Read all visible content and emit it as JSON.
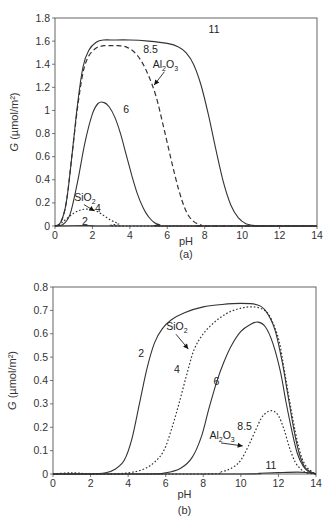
{
  "chart_data": [
    {
      "type": "line",
      "caption": "(a)",
      "xlabel": "pH",
      "ylabel": "G (µmol/m²)",
      "xlim": [
        0,
        14
      ],
      "ylim": [
        0,
        1.8
      ],
      "xticks": [
        0,
        2,
        4,
        6,
        8,
        10,
        12,
        14
      ],
      "yticks": [
        0,
        0.2,
        0.4,
        0.6,
        0.8,
        1,
        1.2,
        1.4,
        1.6,
        1.8
      ],
      "ytick_labels": [
        "0",
        "0.2",
        "0.4",
        "0.6",
        "0.8",
        "1",
        "1.2",
        "1.4",
        "1.6",
        "1.8"
      ],
      "grid": false,
      "series": [
        {
          "name": "11",
          "style": "solid",
          "x": [
            0,
            0.3,
            0.6,
            0.9,
            1.2,
            1.5,
            1.8,
            2.2,
            2.6,
            3,
            4,
            5,
            6,
            6.6,
            7,
            7.4,
            7.8,
            8.2,
            8.6,
            9,
            9.4,
            9.8,
            10.2,
            10.6,
            11,
            14
          ],
          "y": [
            0,
            0.03,
            0.2,
            0.6,
            1.05,
            1.38,
            1.52,
            1.59,
            1.61,
            1.61,
            1.61,
            1.6,
            1.58,
            1.55,
            1.5,
            1.4,
            1.22,
            0.96,
            0.66,
            0.38,
            0.18,
            0.07,
            0.02,
            0.005,
            0,
            0
          ]
        },
        {
          "name": "8.5",
          "style": "dashed",
          "x": [
            0,
            0.3,
            0.6,
            0.9,
            1.2,
            1.5,
            1.8,
            2.2,
            2.6,
            3,
            3.4,
            3.8,
            4.2,
            4.6,
            5,
            5.4,
            5.8,
            6.2,
            6.6,
            7,
            7.4,
            7.8,
            8,
            14
          ],
          "y": [
            0,
            0.03,
            0.2,
            0.6,
            1.02,
            1.33,
            1.47,
            1.54,
            1.56,
            1.56,
            1.56,
            1.55,
            1.51,
            1.43,
            1.3,
            1.12,
            0.86,
            0.58,
            0.32,
            0.13,
            0.04,
            0.01,
            0,
            0
          ]
        },
        {
          "name": "6",
          "style": "solid",
          "x": [
            0,
            0.4,
            0.8,
            1.2,
            1.6,
            2,
            2.3,
            2.6,
            2.9,
            3.2,
            3.5,
            3.8,
            4.1,
            4.4,
            4.7,
            5,
            5.3,
            5.6,
            6,
            14
          ],
          "y": [
            0,
            0.01,
            0.1,
            0.38,
            0.72,
            0.97,
            1.06,
            1.07,
            1.03,
            0.94,
            0.8,
            0.62,
            0.44,
            0.28,
            0.16,
            0.08,
            0.03,
            0.01,
            0,
            0
          ]
        },
        {
          "name": "4",
          "style": "dotted",
          "x": [
            0,
            0.3,
            0.6,
            1,
            1.4,
            1.8,
            2.2,
            2.6,
            3,
            3.4,
            3.8,
            14
          ],
          "y": [
            0,
            0.02,
            0.06,
            0.11,
            0.14,
            0.145,
            0.13,
            0.09,
            0.05,
            0.02,
            0,
            0
          ]
        },
        {
          "name": "2",
          "style": "solid",
          "x": [
            0,
            1,
            2,
            3,
            14
          ],
          "y": [
            0,
            0.002,
            0.003,
            0,
            0
          ]
        }
      ],
      "annotations": [
        {
          "text": "11",
          "x": 8.5,
          "y": 1.67
        },
        {
          "text": "8.5",
          "x": 5.1,
          "y": 1.5
        },
        {
          "text": "Al",
          "sub1": "2",
          "mid": "O",
          "sub2": "3",
          "x": 5.9,
          "y": 1.37,
          "arrow_to": [
            5.3,
            1.22
          ]
        },
        {
          "text": "6",
          "x": 3.8,
          "y": 0.98
        },
        {
          "text": "Si",
          "mid": "O",
          "sub2": "2",
          "x": 1.6,
          "y": 0.22,
          "arrow_to": [
            2.1,
            0.13
          ]
        },
        {
          "text": "4",
          "x": 2.3,
          "y": 0.12
        },
        {
          "text": "2",
          "x": 1.6,
          "y": 0.01
        }
      ]
    },
    {
      "type": "line",
      "caption": "(b)",
      "xlabel": "pH",
      "ylabel": "G (µmol/m²)",
      "xlim": [
        0,
        14
      ],
      "ylim": [
        0,
        0.8
      ],
      "xticks": [
        0,
        2,
        4,
        6,
        8,
        10,
        12,
        14
      ],
      "yticks": [
        0,
        0.1,
        0.2,
        0.3,
        0.4,
        0.5,
        0.6,
        0.7,
        0.8
      ],
      "ytick_labels": [
        "0",
        "0.1",
        "0.2",
        "0.3",
        "0.4",
        "0.5",
        "0.6",
        "0.7",
        "0.8"
      ],
      "grid": false,
      "series": [
        {
          "name": "2",
          "style": "solid",
          "x": [
            0,
            2,
            2.8,
            3.3,
            3.8,
            4.2,
            4.6,
            5,
            5.4,
            5.8,
            6.3,
            7,
            8,
            9,
            10,
            10.8,
            11.3,
            11.8,
            12.2,
            12.5,
            12.8,
            13.1,
            13.4,
            13.7,
            14
          ],
          "y": [
            0,
            0,
            0.005,
            0.02,
            0.06,
            0.15,
            0.3,
            0.45,
            0.56,
            0.62,
            0.66,
            0.69,
            0.715,
            0.725,
            0.73,
            0.725,
            0.7,
            0.62,
            0.48,
            0.34,
            0.2,
            0.09,
            0.03,
            0.01,
            0
          ]
        },
        {
          "name": "4",
          "style": "dotted",
          "x": [
            0,
            1,
            2,
            3,
            4,
            4.8,
            5.4,
            5.9,
            6.3,
            6.7,
            7.1,
            7.5,
            8,
            8.6,
            9.2,
            9.8,
            10.4,
            11,
            11.5,
            12,
            12.3,
            12.6,
            12.9,
            13.2,
            13.5,
            13.8,
            14
          ],
          "y": [
            0,
            0.005,
            0,
            0,
            0.005,
            0.02,
            0.05,
            0.1,
            0.19,
            0.3,
            0.42,
            0.53,
            0.6,
            0.65,
            0.685,
            0.705,
            0.715,
            0.71,
            0.68,
            0.58,
            0.45,
            0.31,
            0.18,
            0.08,
            0.03,
            0.01,
            0
          ]
        },
        {
          "name": "6",
          "style": "solid",
          "x": [
            0,
            5,
            6,
            6.8,
            7.4,
            7.9,
            8.3,
            8.7,
            9.1,
            9.5,
            10,
            10.5,
            10.9,
            11.3,
            11.7,
            12.1,
            12.4,
            12.7,
            13,
            13.3,
            13.6,
            14
          ],
          "y": [
            0,
            0,
            0.005,
            0.025,
            0.07,
            0.16,
            0.28,
            0.39,
            0.48,
            0.55,
            0.61,
            0.64,
            0.65,
            0.63,
            0.56,
            0.44,
            0.31,
            0.19,
            0.09,
            0.035,
            0.01,
            0
          ]
        },
        {
          "name": "8.5",
          "style": "dotted",
          "x": [
            0,
            8,
            9,
            9.6,
            10,
            10.4,
            10.8,
            11.1,
            11.4,
            11.7,
            12,
            12.3,
            12.6,
            12.9,
            13.2,
            13.5,
            14
          ],
          "y": [
            0,
            0,
            0.01,
            0.03,
            0.06,
            0.12,
            0.19,
            0.24,
            0.265,
            0.27,
            0.25,
            0.19,
            0.11,
            0.05,
            0.02,
            0.005,
            0
          ]
        },
        {
          "name": "11",
          "style": "solid",
          "x": [
            0,
            10,
            11,
            12,
            13,
            13.5,
            14
          ],
          "y": [
            0,
            0,
            0.003,
            0.006,
            0.008,
            0.006,
            0
          ]
        }
      ],
      "annotations": [
        {
          "text": "2",
          "x": 4.7,
          "y": 0.5
        },
        {
          "text": "Si",
          "mid": "O",
          "sub2": "2",
          "x": 6.6,
          "y": 0.615,
          "arrow_to": [
            7.2,
            0.535
          ]
        },
        {
          "text": "4",
          "x": 6.6,
          "y": 0.43
        },
        {
          "text": "6",
          "x": 8.7,
          "y": 0.38
        },
        {
          "text": "8.5",
          "x": 10.2,
          "y": 0.19
        },
        {
          "text": "Al",
          "sub1": "2",
          "mid": "O",
          "sub2": "3",
          "x": 9.0,
          "y": 0.15,
          "arrow_to": [
            10.1,
            0.12
          ]
        },
        {
          "text": "11",
          "x": 11.6,
          "y": 0.02
        }
      ]
    }
  ],
  "layout": [
    {
      "left": 55,
      "right": 317,
      "top": 18,
      "bottom": 226,
      "caption_y": 258,
      "xlabel_y": 245,
      "ylabel_x": 18
    },
    {
      "left": 53,
      "right": 316,
      "top": 287,
      "bottom": 474,
      "caption_y": 514,
      "xlabel_y": 498,
      "ylabel_x": 16
    }
  ]
}
